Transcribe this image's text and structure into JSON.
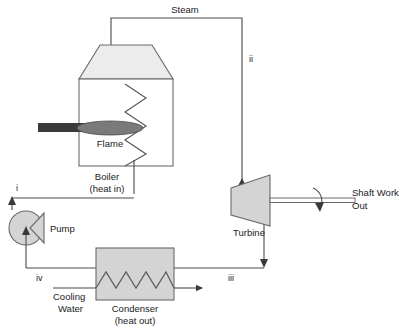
{
  "diagram": {
    "colors": {
      "line": "#4a4a4a",
      "outline": "#6a6a6a",
      "fill_light": "#ececec",
      "fill_gray": "#d4d4d4",
      "burner": "#3a3a3a",
      "flame": "#7a7a7a",
      "text": "#1a1a1a"
    },
    "components": {
      "boiler": {
        "label_line1": "Boiler",
        "label_line2": "(heat in)"
      },
      "turbine": {
        "label": "Turbine"
      },
      "condenser": {
        "label_line1": "Condenser",
        "label_line2": "(heat out)"
      },
      "pump": {
        "label": "Pump"
      },
      "flame": {
        "label": "Flame"
      },
      "cooling_water": {
        "label_line1": "Cooling",
        "label_line2": "Water"
      }
    },
    "streams": {
      "steam": {
        "label": "Steam"
      },
      "shaft_work": {
        "label_line1": "Shaft Work",
        "label_line2": "Out"
      }
    },
    "state_points": [
      {
        "id": "i",
        "label": "i"
      },
      {
        "id": "ii",
        "label": "ii"
      },
      {
        "id": "iii",
        "label": "iii"
      },
      {
        "id": "iv",
        "label": "iv"
      }
    ]
  }
}
